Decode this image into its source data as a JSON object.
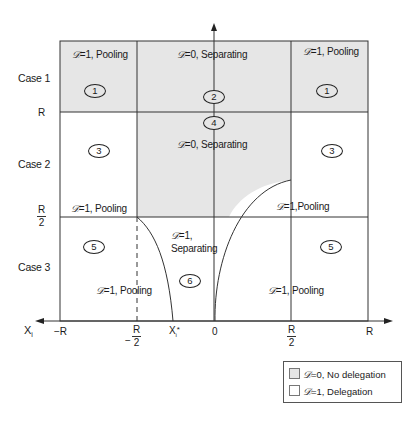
{
  "diagram": {
    "colors": {
      "shaded": "#e6e6e6",
      "unshaded": "#ffffff",
      "line": "#333333"
    },
    "rows": [
      {
        "label": "Case 1"
      },
      {
        "label": "Case 2"
      },
      {
        "label": "Case 3"
      }
    ],
    "y_ticks": [
      {
        "label": "R"
      },
      {
        "num": "R",
        "den": "2"
      }
    ],
    "x_axis": {
      "name": "X",
      "name_sub": "i",
      "ticks": [
        {
          "label": "−R"
        },
        {
          "prefix": "−",
          "num": "R",
          "den": "2"
        },
        {
          "label": "X",
          "sub": "i",
          "sup": "*"
        },
        {
          "label": "0"
        },
        {
          "num": "R",
          "den": "2"
        },
        {
          "label": "R"
        }
      ]
    },
    "regions": {
      "case1_left": {
        "text": "=1, Pooling",
        "d": "𝒟",
        "number": "1",
        "shaded": true
      },
      "case1_mid": {
        "text": "=0, Separating",
        "d": "𝒟",
        "number": "2",
        "shaded": true
      },
      "case1_right": {
        "text": "=1, Pooling",
        "d": "𝒟",
        "number": "1",
        "shaded": true
      },
      "case2_left": {
        "text": "=1, Pooling",
        "d": "𝒟",
        "number": "3",
        "shaded": false
      },
      "case2_mid": {
        "text": "=0, Separating",
        "d": "𝒟",
        "number": "4",
        "shaded": true
      },
      "case2_right": {
        "text": "=1,Pooling",
        "d": "𝒟",
        "number": "3",
        "shaded": false
      },
      "case3_left": {
        "text": "=1, Pooling",
        "d": "𝒟",
        "number": "5",
        "shaded": false
      },
      "case3_mid": {
        "text_line1": "=1,",
        "text_line2": "Separating",
        "d": "𝒟",
        "number": "6",
        "shaded": false
      },
      "case3_right": {
        "text": "=1, Pooling",
        "d": "𝒟",
        "number": "5",
        "shaded": false
      }
    },
    "legend": [
      {
        "d": "𝒟",
        "text": "=0, No delegation",
        "swatch": "#e6e6e6"
      },
      {
        "d": "𝒟",
        "text": "=1, Delegation",
        "swatch": "#ffffff"
      }
    ]
  }
}
